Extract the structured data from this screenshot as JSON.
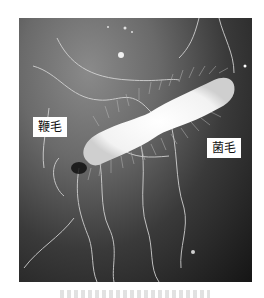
{
  "figure": {
    "labels": {
      "flagella": "鞭毛",
      "pili": "菌毛"
    }
  }
}
